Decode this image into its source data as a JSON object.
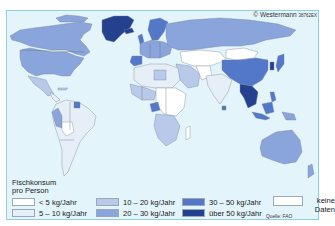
{
  "header": {
    "copyright": "© Westermann",
    "code": "38762EX"
  },
  "legend": {
    "title_line1": "Fischkonsum",
    "title_line2": "pro Person",
    "items": [
      {
        "label": "< 5 kg/Jahr",
        "color": "#ffffff"
      },
      {
        "label": "5 – 10 kg/Jahr",
        "color": "#e6eef7"
      },
      {
        "label": "10 – 20 kg/Jahr",
        "color": "#b9c9ea"
      },
      {
        "label": "20 – 30 kg/Jahr",
        "color": "#8aa4dc"
      },
      {
        "label": "30 – 50 kg/Jahr",
        "color": "#5378c9"
      },
      {
        "label": "über 50 kg/Jahr",
        "color": "#23418f"
      }
    ],
    "nodata": {
      "label_line1": "keine",
      "label_line2": "Daten",
      "color": "#ffffff"
    },
    "source": "Quelle: FAO"
  },
  "map": {
    "title": "Fischkonsum pro Person",
    "ocean_color": "#e3f4fa",
    "regions": [
      {
        "name": "Kanada",
        "class": "20 – 30 kg/Jahr"
      },
      {
        "name": "USA",
        "class": "20 – 30 kg/Jahr"
      },
      {
        "name": "Grönland",
        "class": "über 50 kg/Jahr"
      },
      {
        "name": "Mexiko",
        "class": "10 – 20 kg/Jahr"
      },
      {
        "name": "Südamerika",
        "class": "5 – 10 kg/Jahr"
      },
      {
        "name": "Peru",
        "class": "20 – 30 kg/Jahr"
      },
      {
        "name": "Bolivien",
        "class": "< 5 kg/Jahr"
      },
      {
        "name": "Russland",
        "class": "20 – 30 kg/Jahr"
      },
      {
        "name": "Skandinavien",
        "class": "30 – 50 kg/Jahr"
      },
      {
        "name": "Westeuropa",
        "class": "20 – 30 kg/Jahr"
      },
      {
        "name": "Spanien/Portugal",
        "class": "30 – 50 kg/Jahr"
      },
      {
        "name": "Nordafrika",
        "class": "5 – 10 kg/Jahr"
      },
      {
        "name": "Zentralafrika",
        "class": "< 5 kg/Jahr"
      },
      {
        "name": "Gabun/Kongo",
        "class": "30 – 50 kg/Jahr"
      },
      {
        "name": "Mongolei",
        "class": "< 5 kg/Jahr"
      },
      {
        "name": "China",
        "class": "30 – 50 kg/Jahr"
      },
      {
        "name": "Japan/Korea",
        "class": "über 50 kg/Jahr"
      },
      {
        "name": "Südostasien",
        "class": "über 50 kg/Jahr"
      },
      {
        "name": "Indien",
        "class": "5 – 10 kg/Jahr"
      },
      {
        "name": "Indonesien",
        "class": "30 – 50 kg/Jahr"
      },
      {
        "name": "Australien",
        "class": "20 – 30 kg/Jahr"
      }
    ]
  }
}
